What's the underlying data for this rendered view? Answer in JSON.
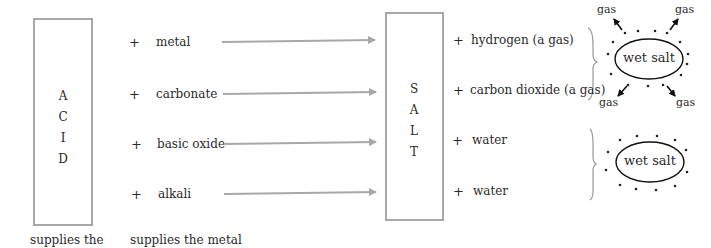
{
  "acid_box": {
    "letters": [
      "A",
      "C",
      "I",
      "D"
    ]
  },
  "salt_box": {
    "letters": [
      "S",
      "A",
      "L",
      "T"
    ]
  },
  "reactants": [
    {
      "plus": "+",
      "label": "metal"
    },
    {
      "plus": "+",
      "label": "carbonate"
    },
    {
      "plus": "+",
      "label": "basic oxide"
    },
    {
      "plus": "+",
      "label": "alkali"
    }
  ],
  "products": [
    {
      "plus": "+",
      "label": "hydrogen (a gas)"
    },
    {
      "plus": "+",
      "label": "carbon dioxide (a gas)"
    },
    {
      "plus": "+",
      "label": "water"
    },
    {
      "plus": "+",
      "label": "water"
    }
  ],
  "captions": {
    "acid": "supplies the",
    "reactant": "supplies the metal"
  },
  "ellipses": [
    {
      "label": "wet salt",
      "gas_labels": [
        "gas",
        "gas",
        "gas",
        "gas"
      ]
    },
    {
      "label": "wet salt"
    }
  ],
  "colors": {
    "box_border": "#a8a8a8",
    "arrow": "#a8a8a8",
    "text": "#2a2a2a"
  }
}
